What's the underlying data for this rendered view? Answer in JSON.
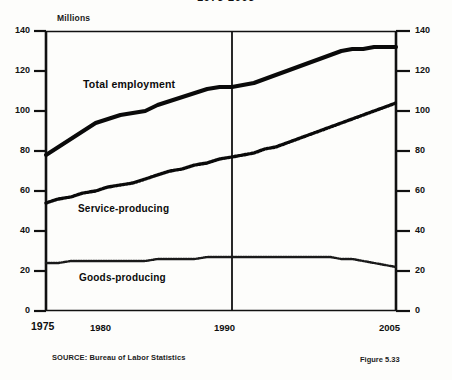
{
  "chart_data": {
    "type": "line",
    "title": "1975-2005",
    "unit_label": "Millions",
    "ylabel": "Millions",
    "xlabel": "",
    "ylim": [
      0,
      140
    ],
    "yticks": [
      0,
      20,
      40,
      60,
      80,
      100,
      120,
      140
    ],
    "yticks_right": [
      0,
      20,
      40,
      60,
      80,
      100,
      120,
      140
    ],
    "xticks": [
      "1975",
      "1980",
      "1990",
      "2005"
    ],
    "xtick_years": [
      1975,
      1980,
      1990,
      2005
    ],
    "xlim": [
      1975,
      2005
    ],
    "grid": false,
    "legend_position": "inline-annotations",
    "reference_line_year": 1990,
    "x": [
      1975,
      1976,
      1977,
      1978,
      1979,
      1980,
      1981,
      1982,
      1983,
      1984,
      1985,
      1986,
      1987,
      1988,
      1989,
      1990,
      1991,
      1992,
      1993,
      1994,
      1995,
      1996,
      1997,
      1998,
      1999,
      2000,
      2001,
      2002,
      2003,
      2004,
      2005
    ],
    "series": [
      {
        "name": "Total employment",
        "style": "solid-thick",
        "values": [
          78,
          82,
          86,
          90,
          94,
          96,
          98,
          99,
          100,
          103,
          105,
          107,
          109,
          111,
          112,
          112,
          113,
          114,
          116,
          118,
          120,
          122,
          124,
          126,
          128,
          130,
          131,
          131,
          132,
          132,
          132
        ]
      },
      {
        "name": "Service-producing",
        "style": "dotted-medium",
        "values": [
          54,
          56,
          57,
          59,
          60,
          62,
          63,
          64,
          66,
          68,
          70,
          71,
          73,
          74,
          76,
          77,
          78,
          79,
          81,
          82,
          84,
          86,
          88,
          90,
          92,
          94,
          96,
          98,
          100,
          102,
          104
        ]
      },
      {
        "name": "Goods-producing",
        "style": "dotted-fine",
        "values": [
          24,
          24,
          25,
          25,
          25,
          25,
          25,
          25,
          25,
          26,
          26,
          26,
          26,
          27,
          27,
          27,
          27,
          27,
          27,
          27,
          27,
          27,
          27,
          27,
          27,
          26,
          26,
          25,
          24,
          23,
          22
        ]
      }
    ],
    "annotations": [
      {
        "text": "Total employment",
        "series": "Total employment"
      },
      {
        "text": "Service-producing",
        "series": "Service-producing"
      },
      {
        "text": "Goods-producing",
        "series": "Goods-producing"
      }
    ],
    "source_prefix": "SOURCE:",
    "source": "Bureau of Labor Statistics",
    "figure_number": "Figure 5.33"
  },
  "axes": {
    "y_labels": [
      "140",
      "120",
      "100",
      "80",
      "60",
      "40",
      "20",
      "0"
    ],
    "y_labels_right": [
      "140",
      "120",
      "100",
      "80",
      "60",
      "40",
      "20",
      "0"
    ],
    "x_labels": [
      "1975",
      "1980",
      "1990",
      "2005"
    ]
  }
}
